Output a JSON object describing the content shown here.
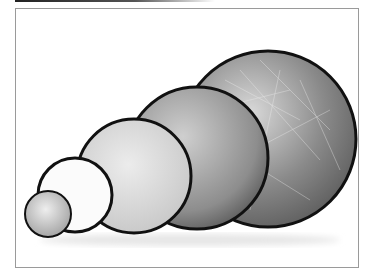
{
  "image": {
    "subject": "collapsible photo reflector discs",
    "discs": [
      {
        "id": "disc-1",
        "surface": "silver",
        "cx": 48,
        "cy": 214,
        "r": 23,
        "fill": "#c8c8c8"
      },
      {
        "id": "disc-2",
        "surface": "white",
        "cx": 75,
        "cy": 195,
        "r": 37,
        "fill": "#fbfbfb"
      },
      {
        "id": "disc-3",
        "surface": "gold",
        "cx": 134,
        "cy": 176,
        "r": 57,
        "fill": "#dcdcdc"
      },
      {
        "id": "disc-4",
        "surface": "silver",
        "cx": 197,
        "cy": 158,
        "r": 71,
        "fill": "#a9a9a9"
      },
      {
        "id": "disc-5",
        "surface": "crumpled-silver",
        "cx": 268,
        "cy": 139,
        "r": 88,
        "fill": "#8e8e8e"
      }
    ],
    "colors": {
      "rim": "#111111",
      "frame": "#9a9a9a",
      "background": "#ffffff"
    }
  }
}
